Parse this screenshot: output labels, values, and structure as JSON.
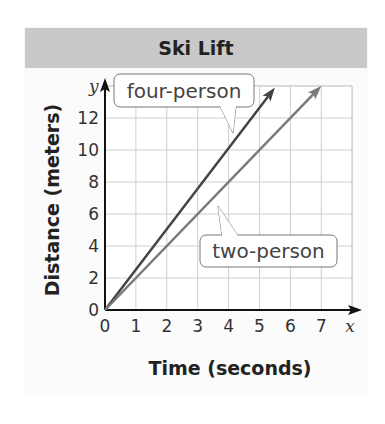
{
  "chart_data": {
    "type": "line",
    "title": "Ski Lift",
    "xlabel": "Time (seconds)",
    "ylabel": "Distance (meters)",
    "x_axis_var": "x",
    "y_axis_var": "y",
    "xlim": [
      0,
      8
    ],
    "ylim": [
      0,
      14
    ],
    "x_ticks": [
      0,
      1,
      2,
      3,
      4,
      5,
      6,
      7
    ],
    "y_ticks": [
      0,
      2,
      4,
      6,
      8,
      10,
      12
    ],
    "grid": true,
    "series": [
      {
        "name": "four-person",
        "x": [
          0,
          5.5
        ],
        "y": [
          0,
          13.9
        ],
        "slope": 2.5,
        "color": "#444444"
      },
      {
        "name": "two-person",
        "x": [
          0,
          7
        ],
        "y": [
          0,
          14
        ],
        "slope": 2,
        "color": "#7a7a7a"
      }
    ],
    "annotations": [
      {
        "text": "four-person",
        "target_series": "four-person"
      },
      {
        "text": "two-person",
        "target_series": "two-person"
      }
    ]
  },
  "labels": {
    "title": "Ski Lift",
    "xlabel": "Time (seconds)",
    "ylabel": "Distance (meters)",
    "x_var": "x",
    "y_var": "y",
    "callout_four": "four-person",
    "callout_two": "two-person"
  }
}
